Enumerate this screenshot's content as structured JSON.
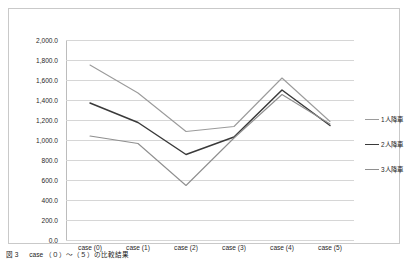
{
  "chart_data": {
    "type": "line",
    "title": "",
    "xlabel": "",
    "ylabel": "",
    "categories": [
      "case (0)",
      "case (1)",
      "case (2)",
      "case (3)",
      "case (4)",
      "case (5)"
    ],
    "series": [
      {
        "name": "1人降車",
        "color": "#9b9b9b",
        "values": [
          1750,
          1470,
          1085,
          1135,
          1620,
          1185
        ]
      },
      {
        "name": "2人降車",
        "color": "#3a3a3a",
        "values": [
          1370,
          1175,
          855,
          1030,
          1500,
          1145
        ]
      },
      {
        "name": "3人降車",
        "color": "#8f8f8f",
        "values": [
          1040,
          965,
          545,
          1020,
          1455,
          1160
        ]
      }
    ],
    "ylim": [
      0,
      2000
    ],
    "ytick_step": 200,
    "ytick_labels": [
      "2,000.0",
      "1,800.0",
      "1,600.0",
      "1,400.0",
      "1,200.0",
      "1,000.0",
      "800.0",
      "600.0",
      "400.0",
      "200.0",
      "0.0"
    ],
    "grid": true,
    "legend_position": "right"
  },
  "caption": "図 3 　 case （０）～（５）の比較結果"
}
